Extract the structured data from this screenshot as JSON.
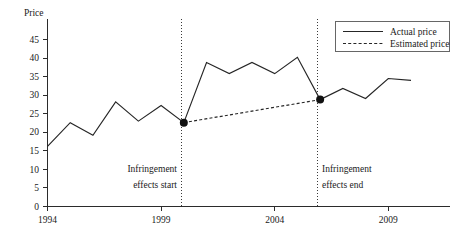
{
  "chart_data": {
    "type": "line",
    "title": "",
    "ylabel": "Price",
    "xlabel": "",
    "xlim": [
      1994,
      2011
    ],
    "ylim": [
      0,
      45
    ],
    "grid": false,
    "legend_position": "top-right",
    "yticks": [
      "0",
      "5",
      "10",
      "15",
      "20",
      "25",
      "30",
      "35",
      "40",
      "45"
    ],
    "ytick_values": [
      0,
      5,
      10,
      15,
      20,
      25,
      30,
      35,
      40,
      45
    ],
    "xticks": [
      "1994",
      "1999",
      "2004",
      "2009"
    ],
    "xtick_values": [
      1994,
      1999,
      2004,
      2009
    ],
    "series": [
      {
        "name": "Actual price",
        "style": "solid",
        "x": [
          1994,
          1995,
          1996,
          1997,
          1998,
          1999,
          2000,
          2001,
          2002,
          2003,
          2004,
          2005,
          2006,
          2007,
          2008,
          2009,
          2010
        ],
        "values": [
          16.2,
          22.6,
          19.2,
          28.2,
          23.0,
          27.2,
          22.6,
          38.8,
          35.8,
          38.8,
          35.8,
          40.2,
          28.8,
          31.8,
          29.1,
          34.5,
          34.0
        ]
      },
      {
        "name": "Estimated price",
        "style": "dotted",
        "x": [
          2000,
          2006
        ],
        "values": [
          22.6,
          28.8
        ]
      }
    ],
    "markers": [
      {
        "name": "infringement-start-point",
        "x": 2000,
        "value": 22.6
      },
      {
        "name": "infringement-end-point",
        "x": 2006,
        "value": 28.8
      }
    ],
    "annotations": [
      {
        "name": "infringement-start",
        "x": 2000,
        "line1": "Infringement",
        "line2": "effects start"
      },
      {
        "name": "infringement-end",
        "x": 2006,
        "line1": "Infringement",
        "line2": "effects end"
      }
    ],
    "legend": [
      {
        "label": "Actual price",
        "style": "solid"
      },
      {
        "label": "Estimated price",
        "style": "dotted"
      }
    ],
    "colors": {
      "line": "#262626",
      "axis": "#2b2b2b",
      "event_line": "#3a3a3a",
      "marker": "#111111",
      "background": "#ffffff"
    }
  }
}
